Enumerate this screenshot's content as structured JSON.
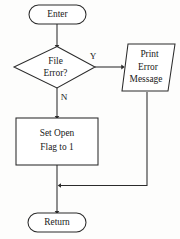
{
  "diagram": {
    "background_color": "#fdfdfc",
    "line_color": "#2b2b2b",
    "text_color": "#1a1a1a",
    "nodes": {
      "start": {
        "label": "Enter",
        "shape": "terminator"
      },
      "decision": {
        "line1": "File",
        "line2": "Error?",
        "shape": "diamond"
      },
      "print": {
        "line1": "Print",
        "line2": "Error",
        "line3": "Message",
        "shape": "parallelogram"
      },
      "process": {
        "line1": "Set Open",
        "line2": "Flag to 1",
        "shape": "rectangle"
      },
      "end": {
        "label": "Return",
        "shape": "terminator"
      }
    },
    "edges": {
      "yes_label": "Y",
      "no_label": "N"
    }
  }
}
